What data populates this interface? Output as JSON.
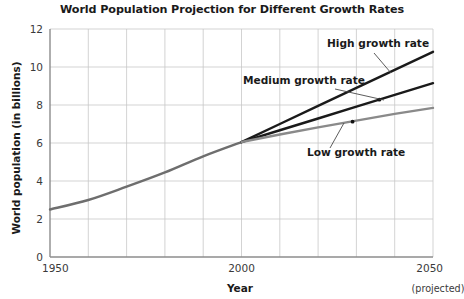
{
  "chart_data": {
    "type": "line",
    "title": "World Population Projection for Different Growth Rates",
    "xlabel": "Year",
    "ylabel": "World population (in billions)",
    "xlim": [
      1950,
      2050
    ],
    "ylim": [
      0,
      12
    ],
    "xticks": [
      1950,
      2000,
      2050
    ],
    "xtick_labels": [
      "1950",
      "2000",
      "2050"
    ],
    "x_projected_note": "(projected)",
    "yticks": [
      0,
      2,
      4,
      6,
      8,
      10,
      12
    ],
    "ytick_labels": [
      "0",
      "2",
      "4",
      "6",
      "8",
      "10",
      "12"
    ],
    "grid": true,
    "grid_x_step": 10,
    "grid_y_step": 2,
    "legend_position": "inline-annotations",
    "historical": {
      "name": "Historical world population",
      "color": "#6e6e6e",
      "x": [
        1950,
        1960,
        1970,
        1980,
        1990,
        2000
      ],
      "values": [
        2.5,
        3.0,
        3.7,
        4.45,
        5.3,
        6.05
      ]
    },
    "series": [
      {
        "name": "High growth rate",
        "label": "High growth rate",
        "color": "#1a1a1a",
        "x": [
          2000,
          2010,
          2020,
          2030,
          2040,
          2050
        ],
        "values": [
          6.05,
          7.0,
          7.95,
          8.9,
          9.85,
          10.8
        ],
        "marker_point": null
      },
      {
        "name": "Medium growth rate",
        "label": "Medium growth rate",
        "color": "#1a1a1a",
        "x": [
          2000,
          2010,
          2020,
          2030,
          2040,
          2050
        ],
        "values": [
          6.05,
          6.67,
          7.29,
          7.91,
          8.53,
          9.15
        ],
        "marker_point": {
          "x": 2036,
          "y": 8.28
        }
      },
      {
        "name": "Low growth rate",
        "label": "Low growth rate",
        "color": "#8a8a8a",
        "x": [
          2000,
          2010,
          2020,
          2030,
          2040,
          2050
        ],
        "values": [
          6.05,
          6.45,
          6.82,
          7.18,
          7.53,
          7.85
        ],
        "marker_point": {
          "x": 2029,
          "y": 7.12
        }
      }
    ],
    "annotations": [
      {
        "text": "High growth rate",
        "text_x": 327,
        "text_y": 47,
        "leader": {
          "x1": 374,
          "y1": 53,
          "x2": 391,
          "y2": 73
        }
      },
      {
        "text": "Medium growth rate",
        "text_x": 243,
        "text_y": 84,
        "leader": {
          "x1": 335,
          "y1": 89,
          "x2": 384,
          "y2": 100
        }
      },
      {
        "text": "Low growth rate",
        "text_x": 307,
        "text_y": 156,
        "leader": {
          "x1": 330,
          "y1": 148,
          "x2": 344,
          "y2": 123
        }
      }
    ]
  },
  "colors": {
    "axis": "#8c8c8c",
    "grid": "#c8c8c8",
    "text": "#231f20",
    "dark_line": "#1a1a1a",
    "gray_line": "#7d7d7d",
    "light_gray_line": "#8f8f8f",
    "background": "#ffffff"
  }
}
